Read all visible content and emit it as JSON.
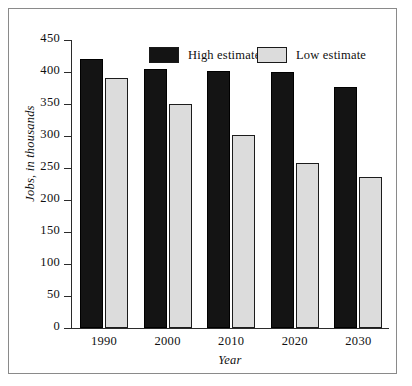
{
  "chart_data": {
    "type": "bar",
    "title": "",
    "xlabel": "Year",
    "ylabel": "Jobs, in thousands",
    "categories": [
      "1990",
      "2000",
      "2010",
      "2020",
      "2030"
    ],
    "series": [
      {
        "name": "High estimate",
        "color": "#141414",
        "values": [
          420,
          405,
          402,
          400,
          377
        ]
      },
      {
        "name": "Low estimate",
        "color": "#dcdcdc",
        "values": [
          390,
          350,
          302,
          258,
          236
        ]
      }
    ],
    "ylim": [
      0,
      450
    ],
    "yticks": [
      0,
      50,
      100,
      150,
      200,
      250,
      300,
      350,
      400,
      450
    ],
    "ytick_labels": [
      "0",
      "50",
      "100",
      "150",
      "200",
      "250",
      "300",
      "350",
      "400",
      "450"
    ],
    "grid": false,
    "legend_position": "top-center"
  },
  "legend": {
    "high_label": "High estimate",
    "low_label": "Low estimate"
  },
  "colors": {
    "high": "#141414",
    "low": "#dcdcdc",
    "axis": "#2b2b2b",
    "frame": "#8a8a8a",
    "text": "#101010"
  }
}
